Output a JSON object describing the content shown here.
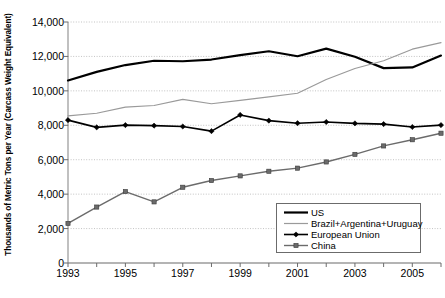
{
  "chart_data": {
    "type": "line",
    "title": "",
    "xlabel": "",
    "ylabel": "Thousands of Metric Tons per Year (Carcass Weight Equivalent)",
    "x": [
      1993,
      1994,
      1995,
      1996,
      1997,
      1998,
      1999,
      2000,
      2001,
      2002,
      2003,
      2004,
      2005,
      2006
    ],
    "xtick_values": [
      1993,
      1995,
      1997,
      1999,
      2001,
      2003,
      2005
    ],
    "xtick_labels": [
      "1993",
      "1995",
      "1997",
      "1999",
      "2001",
      "2003",
      "2005"
    ],
    "xlim": [
      1993,
      2006
    ],
    "ytick_values": [
      0,
      2000,
      4000,
      6000,
      8000,
      10000,
      12000,
      14000
    ],
    "ytick_labels": [
      "0",
      "2,000",
      "4,000",
      "6,000",
      "8,000",
      "10,000",
      "12,000",
      "14,000"
    ],
    "ylim": [
      0,
      14000
    ],
    "grid": true,
    "grid_axis": "y",
    "legend_position": "lower-right",
    "series": [
      {
        "name": "US",
        "color": "#000000",
        "width": 2.2,
        "marker": "none",
        "values": [
          10600,
          11100,
          11500,
          11750,
          11720,
          11820,
          12080,
          12300,
          12010,
          12450,
          11980,
          11320,
          11360,
          12050
        ]
      },
      {
        "name": "Brazil+Argentina+Uruguay",
        "color": "#9a9a9a",
        "width": 1.2,
        "marker": "none",
        "values": [
          8550,
          8700,
          9050,
          9150,
          9500,
          9250,
          9450,
          9650,
          9860,
          10660,
          11300,
          11750,
          12420,
          12800
        ]
      },
      {
        "name": "European Union",
        "color": "#000000",
        "width": 1.6,
        "marker": "diamond",
        "values": [
          8300,
          7880,
          8010,
          7980,
          7930,
          7660,
          8600,
          8270,
          8120,
          8190,
          8110,
          8070,
          7900,
          8010
        ]
      },
      {
        "name": "China",
        "color": "#6b6b6b",
        "width": 1.4,
        "marker": "square",
        "values": [
          2300,
          3250,
          4150,
          3550,
          4400,
          4790,
          5060,
          5330,
          5510,
          5870,
          6310,
          6800,
          7160,
          7540
        ]
      }
    ]
  },
  "legend": {
    "entries": [
      {
        "label": "US"
      },
      {
        "label": "Brazil+Argentina+Uruguay"
      },
      {
        "label": "European Union"
      },
      {
        "label": "China"
      }
    ]
  }
}
